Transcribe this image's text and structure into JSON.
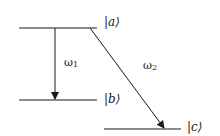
{
  "diagram": {
    "type": "energy-level-diagram",
    "levels": [
      {
        "id": "a",
        "label": "|a⟩",
        "y": 28,
        "x1": 19,
        "x2": 97
      },
      {
        "id": "b",
        "label": "|b⟩",
        "y": 100,
        "x1": 19,
        "x2": 97
      },
      {
        "id": "c",
        "label": "|c⟩",
        "y": 129,
        "x1": 104,
        "x2": 181
      }
    ],
    "transitions": [
      {
        "from": "a",
        "to": "b",
        "label": "ω",
        "subscript": "1"
      },
      {
        "from": "a",
        "to": "c",
        "label": "ω",
        "subscript": "2"
      }
    ],
    "colors": {
      "line": "#1a1a1a",
      "background": "#ffffff"
    }
  }
}
